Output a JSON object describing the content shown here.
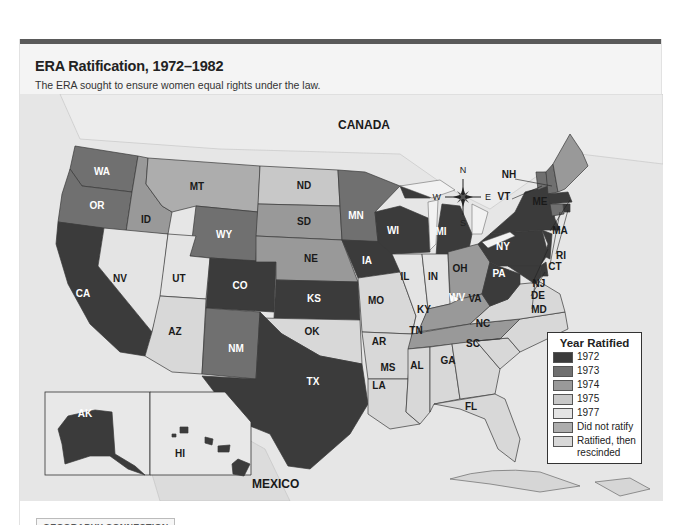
{
  "header": {
    "title": "ERA Ratification, 1972–1982",
    "subtitle": "The ERA sought to ensure women equal rights under the law."
  },
  "map": {
    "region_labels": {
      "canada": "CANADA",
      "mexico": "MEXICO"
    },
    "compass": {
      "n": "N",
      "s": "S",
      "e": "E",
      "w": "W"
    },
    "colors": {
      "1972": "#3b3b3b",
      "1973": "#707070",
      "1974": "#999999",
      "1975": "#c8c8c8",
      "1977": "#e4e4e4",
      "did_not_ratify": "#adadad",
      "rescinded": "#d8d8d8"
    },
    "states": {
      "WA": "WA",
      "OR": "OR",
      "CA": "CA",
      "ID": "ID",
      "NV": "NV",
      "MT": "MT",
      "WY": "WY",
      "UT": "UT",
      "AZ": "AZ",
      "CO": "CO",
      "NM": "NM",
      "ND": "ND",
      "SD": "SD",
      "NE": "NE",
      "KS": "KS",
      "OK": "OK",
      "TX": "TX",
      "MN": "MN",
      "IA": "IA",
      "MO": "MO",
      "AR": "AR",
      "LA": "LA",
      "WI": "WI",
      "IL": "IL",
      "MI": "MI",
      "IN": "IN",
      "OH": "OH",
      "KY": "KY",
      "TN": "TN",
      "MS": "MS",
      "AL": "AL",
      "GA": "GA",
      "FL": "FL",
      "SC": "SC",
      "NC": "NC",
      "VA": "VA",
      "WV": "WV",
      "PA": "PA",
      "NY": "NY",
      "VT": "VT",
      "NH": "NH",
      "ME": "ME",
      "MA": "MA",
      "RI": "RI",
      "CT": "CT",
      "NJ": "NJ",
      "DE": "DE",
      "MD": "MD",
      "AK": "AK",
      "HI": "HI"
    }
  },
  "legend": {
    "title": "Year Ratified",
    "items": [
      {
        "label": "1972",
        "color": "#3b3b3b"
      },
      {
        "label": "1973",
        "color": "#707070"
      },
      {
        "label": "1974",
        "color": "#999999"
      },
      {
        "label": "1975",
        "color": "#c8c8c8"
      },
      {
        "label": "1977",
        "color": "#e4e4e4"
      },
      {
        "label": "Did not ratify",
        "color": "#adadad"
      },
      {
        "label": "Ratified, then rescinded",
        "color": "#d8d8d8"
      }
    ]
  },
  "footer": {
    "tag": "GEOGRAPHY CONNECTION"
  }
}
